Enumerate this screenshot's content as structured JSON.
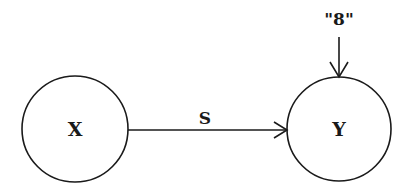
{
  "diagram": {
    "nodes": [
      {
        "id": "X",
        "label": "X",
        "cx": 75,
        "cy": 129,
        "r": 53
      },
      {
        "id": "Y",
        "label": "Y",
        "cx": 339,
        "cy": 129,
        "r": 52
      }
    ],
    "edges": [
      {
        "from": "X",
        "to": "Y",
        "label": "S"
      }
    ],
    "inputs": [
      {
        "to": "Y",
        "label": "\"8\""
      }
    ],
    "colors": {
      "stroke": "#1a1a1a",
      "background": "#ffffff"
    }
  }
}
